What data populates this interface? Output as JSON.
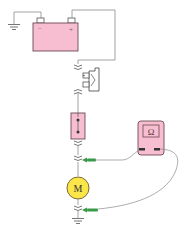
{
  "diagram": {
    "type": "circuit-resistance-test",
    "components": {
      "battery": {
        "neg_label": "−",
        "pos_label": "+",
        "fill": "#f7bdd0"
      },
      "relay": {
        "symbol": "switch-contacts"
      },
      "fuse": {
        "fill": "#f7bdd0"
      },
      "multimeter": {
        "label": "Ω",
        "fill": "#f7bdd0"
      },
      "motor": {
        "label": "M",
        "fill": "#fbe64a"
      }
    },
    "colors": {
      "wire": "#8a8a8a",
      "probe": "#3a9a4a",
      "pink": "#f7bdd0",
      "motor": "#fbe64a"
    }
  }
}
